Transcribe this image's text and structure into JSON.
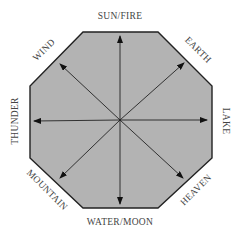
{
  "diagram": {
    "shape": "octagon",
    "fill": "#b3b3b3",
    "stroke": "#222222",
    "center": [
      120,
      120
    ],
    "labels": {
      "top": "SUN/FIRE",
      "top_right": "EARTH",
      "right": "LAKE",
      "bottom_right": "HEAVEN",
      "bottom": "WATER/MOON",
      "bottom_left": "MOUNTAIN",
      "left": "THUNDER",
      "top_left": "WIND"
    }
  }
}
